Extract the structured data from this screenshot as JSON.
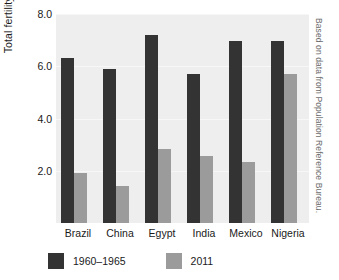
{
  "chart_data": {
    "type": "bar",
    "title": "",
    "subtitle": "",
    "xlabel": "",
    "ylabel": "Total fertility rate",
    "categories": [
      "Brazil",
      "China",
      "Egypt",
      "India",
      "Mexico",
      "Nigeria"
    ],
    "series": [
      {
        "name": "1960–1965",
        "color": "#333333",
        "values": [
          6.3,
          5.9,
          7.2,
          5.7,
          6.95,
          6.95
        ]
      },
      {
        "name": "2011",
        "color": "#9b9b9b",
        "values": [
          1.9,
          1.4,
          2.85,
          2.55,
          2.35,
          5.7
        ]
      }
    ],
    "ylim": [
      0,
      8
    ],
    "yticks": [
      8.0,
      6.0,
      4.0,
      2.0
    ],
    "ytick_labels": [
      "8.0",
      "6.0",
      "4.0",
      "2.0"
    ],
    "grid": true,
    "grid_axis": "y",
    "legend_position": "bottom",
    "plot_background": "#eeeeee",
    "annotation": "Based on data from Population Reference Bureau."
  },
  "legend": {
    "items": [
      {
        "label": "1960–1965",
        "color": "#333333"
      },
      {
        "label": "2011",
        "color": "#9b9b9b"
      }
    ]
  },
  "credit": "Based on data from Population Reference Bureau."
}
